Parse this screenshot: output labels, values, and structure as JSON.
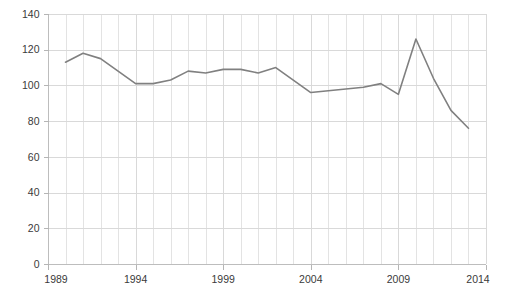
{
  "chart_data": {
    "type": "line",
    "title": "",
    "subtitle": "",
    "xlabel": "",
    "ylabel": "",
    "xlim": [
      1989,
      2014
    ],
    "ylim": [
      0,
      140
    ],
    "grid": true,
    "legend": false,
    "legend_position": "none",
    "line_color": "#808080",
    "grid_color": "#d9d9d9",
    "axis_color": "#bdbdbd",
    "text_color": "#3a3a3a",
    "x_tick_labels": [
      "1989",
      "1994",
      "1999",
      "2004",
      "2009",
      "2014"
    ],
    "x_tick_values": [
      1989,
      1994,
      1999,
      2004,
      2009,
      2014
    ],
    "x_minor_step": 1,
    "y_tick_labels": [
      "0",
      "20",
      "40",
      "60",
      "80",
      "100",
      "120",
      "140"
    ],
    "y_tick_values": [
      0,
      20,
      40,
      60,
      80,
      100,
      120,
      140
    ],
    "series": [
      {
        "name": "series-1",
        "color": "#808080",
        "x": [
          1990,
          1991,
          1992,
          1993,
          1994,
          1995,
          1996,
          1997,
          1998,
          1999,
          2000,
          2001,
          2002,
          2003,
          2004,
          2005,
          2006,
          2007,
          2008,
          2009,
          2010,
          2011,
          2012,
          2013
        ],
        "values": [
          113,
          118,
          115,
          108,
          101,
          101,
          103,
          108,
          107,
          109,
          109,
          107,
          110,
          103,
          96,
          97,
          98,
          99,
          101,
          95,
          126,
          104,
          86,
          76
        ]
      }
    ]
  }
}
